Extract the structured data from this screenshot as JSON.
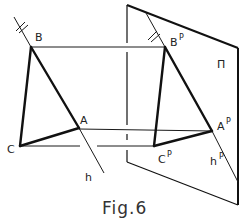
{
  "figure": {
    "caption": "Fig.6",
    "plane_label": "Π",
    "points": {
      "B": {
        "label": "B"
      },
      "A": {
        "label": "A"
      },
      "C": {
        "label": "C"
      },
      "BP": {
        "label": "B",
        "sup": "P"
      },
      "AP": {
        "label": "A",
        "sup": "P"
      },
      "CP": {
        "label": "C",
        "sup": "P"
      }
    },
    "lines": {
      "h": {
        "label": "h"
      },
      "hP": {
        "label": "h",
        "sup": "P"
      }
    }
  }
}
